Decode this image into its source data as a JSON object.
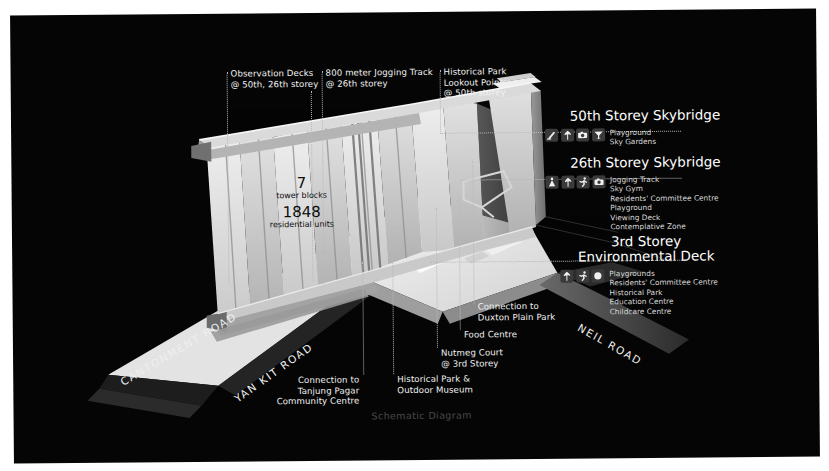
{
  "caption": "Schematic Diagram",
  "stats": {
    "towers_value": "7",
    "towers_label": "tower blocks",
    "units_value": "1848",
    "units_label": "residential units"
  },
  "callouts": [
    {
      "name": "observation-decks",
      "text": "Observation Decks\n@ 50th, 26th storey"
    },
    {
      "name": "jogging-track",
      "text": "800 meter Jogging Track\n@ 26th storey"
    },
    {
      "name": "historical-park-lookout",
      "text": "Historical Park\nLookout Points\n@ 50th storey"
    },
    {
      "name": "duxton-plain-park",
      "text": "Connection to\nDuxton Plain Park"
    },
    {
      "name": "food-centre",
      "text": "Food Centre"
    },
    {
      "name": "nutmeg-court",
      "text": "Nutmeg Court\n@ 3rd Storey"
    },
    {
      "name": "historical-park-museum",
      "text": "Historical Park &\nOutdoor Museum"
    },
    {
      "name": "tanjung-pagar-cc",
      "text": "Connection to\nTanjung Pagar\nCommunity Centre"
    }
  ],
  "legends": [
    {
      "name": "skybridge-50",
      "title": "50th Storey Skybridge",
      "icons": [
        "slide-icon",
        "tree-icon",
        "camera-icon",
        "umbrella-icon"
      ],
      "items": "Playground\nSky Gardens"
    },
    {
      "name": "skybridge-26",
      "title": "26th Storey Skybridge",
      "icons": [
        "gym-icon",
        "tree-icon",
        "runner-icon",
        "camera-icon"
      ],
      "items": "Jogging Track\nSky Gym\nResidents' Committee Centre\nPlayground\nViewing Deck\nContemplative Zone"
    },
    {
      "name": "environmental-deck-3",
      "title": "3rd Storey\nEnvironmental Deck",
      "icons": [
        "tree-icon",
        "runner-icon",
        "circle-icon"
      ],
      "items": "Playgrounds\nResidents' Committee Centre\nHistorical Park\nEducation Centre\nChildcare Centre"
    }
  ],
  "roads": [
    {
      "name": "cantonment-road",
      "text": "CANTONMENT ROAD"
    },
    {
      "name": "yan-kit-road",
      "text": "YAN KIT ROAD"
    },
    {
      "name": "neil-road",
      "text": "NEIL ROAD"
    }
  ],
  "colors": {
    "background": "#050505",
    "text": "#f2f2f2",
    "leader": "#b9b9b9",
    "caption": "#4a4a4a"
  }
}
